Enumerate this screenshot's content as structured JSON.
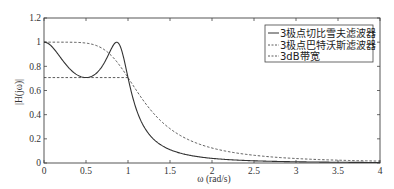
{
  "chart_data": {
    "type": "line",
    "title": "",
    "xlabel": "ω (rad/s)",
    "ylabel": "|H(jω)|",
    "xlim": [
      0,
      4
    ],
    "ylim": [
      0,
      1.2
    ],
    "xticks": [
      0,
      0.5,
      1,
      1.5,
      2,
      2.5,
      3,
      3.5,
      4
    ],
    "xtick_labels": [
      "0",
      "0.5",
      "1",
      "1.5",
      "2",
      "2.5",
      "3",
      "3.5",
      "4"
    ],
    "yticks": [
      0,
      0.2,
      0.4,
      0.6,
      0.8,
      1,
      1.2
    ],
    "ytick_labels": [
      "0",
      "0.2",
      "0.4",
      "0.6",
      "0.8",
      "1",
      "1.2"
    ],
    "grid": false,
    "legend_position": "upper right",
    "series": [
      {
        "name": "3极点切比雪夫滤波器",
        "style": "solid",
        "x": [
          0,
          0.1,
          0.2,
          0.3,
          0.4,
          0.5,
          0.6,
          0.7,
          0.8,
          0.866,
          0.9,
          1.0,
          1.1,
          1.2,
          1.3,
          1.5,
          2.0,
          2.5,
          3.0,
          3.5,
          4.0
        ],
        "values": [
          1.0,
          0.9,
          0.8,
          0.74,
          0.71,
          0.707,
          0.72,
          0.78,
          0.93,
          1.0,
          0.98,
          0.707,
          0.4,
          0.24,
          0.16,
          0.08,
          0.03,
          0.016,
          0.009,
          0.006,
          0.004
        ]
      },
      {
        "name": "3极点巴特沃斯滤波器",
        "style": "dashed",
        "x": [
          0,
          0.2,
          0.4,
          0.6,
          0.8,
          1.0,
          1.2,
          1.4,
          1.6,
          2.0,
          2.5,
          3.0,
          3.5,
          4.0
        ],
        "values": [
          1.0,
          1.0,
          0.998,
          0.977,
          0.888,
          0.707,
          0.5,
          0.34,
          0.24,
          0.124,
          0.064,
          0.037,
          0.023,
          0.016
        ]
      },
      {
        "name": "3dB带宽",
        "style": "dashed",
        "x": [
          0,
          1.0
        ],
        "values": [
          0.707,
          0.707
        ]
      }
    ]
  },
  "legend": {
    "items": [
      {
        "marker": "—",
        "label": "3极点切比雪夫滤波器"
      },
      {
        "marker": "---",
        "label": "3极点巴特沃斯滤波器"
      },
      {
        "marker": "---",
        "label": "3dB带宽"
      }
    ]
  },
  "axes": {
    "xlabel": "ω (rad/s)",
    "ylabel": "|H(jω)|"
  },
  "colors": {
    "line": "#333333",
    "axis": "#444444",
    "background": "#ffffff"
  }
}
